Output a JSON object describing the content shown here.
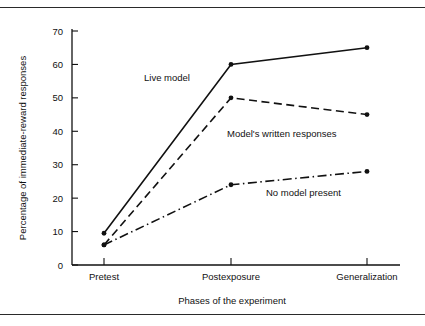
{
  "figure": {
    "has_top_rule": true,
    "has_bottom_rule": true,
    "background_color": "#ffffff",
    "ink_color": "#111111"
  },
  "axes": {
    "y_title": "Percentage of immediate-reward responses",
    "x_title": "Phases of the experiment",
    "y_ticks": [
      "0",
      "10",
      "20",
      "30",
      "40",
      "50",
      "60",
      "70"
    ],
    "x_ticks": [
      "Pretest",
      "Postexposure",
      "Generalization"
    ]
  },
  "annotations": {
    "live_model": "Live model",
    "model_written": "Model's written responses",
    "no_model": "No model present"
  },
  "chart_data": {
    "type": "line",
    "title": "",
    "subtitle": "",
    "xlabel": "Phases of the experiment",
    "ylabel": "Percentage of immediate-reward responses",
    "categories": [
      "Pretest",
      "Postexposure",
      "Generalization"
    ],
    "ylim": [
      0,
      70
    ],
    "yticks": [
      0,
      10,
      20,
      30,
      40,
      50,
      60,
      70
    ],
    "grid": false,
    "legend_position": "inline-annotations",
    "series": [
      {
        "name": "Live model",
        "values": [
          9.5,
          60,
          65
        ],
        "line_style": "solid",
        "color": "#111111",
        "marker": "filled-circle"
      },
      {
        "name": "Model's written responses",
        "values": [
          6,
          50,
          45
        ],
        "line_style": "dashed",
        "color": "#111111",
        "marker": "filled-circle"
      },
      {
        "name": "No model present",
        "values": [
          6,
          24,
          28
        ],
        "line_style": "dash-dot",
        "color": "#111111",
        "marker": "filled-circle"
      }
    ]
  }
}
